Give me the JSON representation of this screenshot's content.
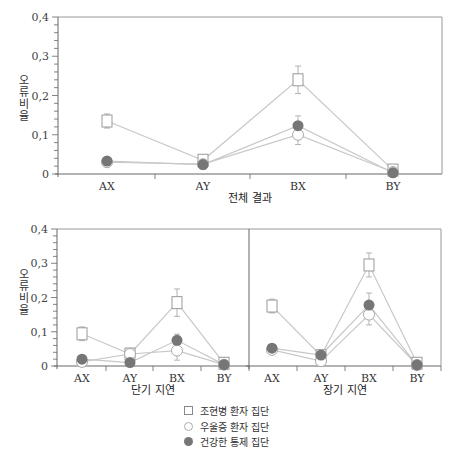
{
  "series_names": [
    "조현병 환자 집단",
    "우울증 환자 집단",
    "건강한 통제 집단"
  ],
  "series_markers": [
    "square",
    "open",
    "filled"
  ],
  "colors": {
    "line": "#c8c8c8",
    "axis": "#666666",
    "filled": "#767676",
    "open_stroke": "#a8a8a8",
    "square_stroke": "#999999"
  },
  "y_axis_label": "오류비율",
  "legend": [
    {
      "marker": "square",
      "label": "조현병 환자 집단"
    },
    {
      "marker": "open",
      "label": "우울증 환자 집단"
    },
    {
      "marker": "filled",
      "label": "건강한 통제 집단"
    }
  ],
  "chart_data": [
    {
      "type": "line",
      "title": "전체 결과",
      "xlabel": "전체 결과",
      "ylabel": "오류비율",
      "categories": [
        "AX",
        "AY",
        "BX",
        "BY"
      ],
      "ylim": [
        0,
        0.4
      ],
      "yticks": [
        "0",
        "0,1",
        "0,2",
        "0,3",
        "0,4"
      ],
      "series": [
        {
          "name": "조현병 환자 집단",
          "values": [
            0.135,
            0.035,
            0.24,
            0.01
          ],
          "err": [
            0.018,
            0.004,
            0.035,
            0.005
          ]
        },
        {
          "name": "우울증 환자 집단",
          "values": [
            0.03,
            0.025,
            0.1,
            0.005
          ],
          "err": [
            0.004,
            0.003,
            0.025,
            0.003
          ]
        },
        {
          "name": "건강한 통제 집단",
          "values": [
            0.033,
            0.024,
            0.123,
            0.003
          ],
          "err": [
            0.004,
            0.003,
            0.025,
            0.003
          ]
        }
      ]
    },
    {
      "type": "line",
      "title": "단기 지연",
      "xlabel": "단기 지연",
      "ylabel": "오류비율",
      "categories": [
        "AX",
        "AY",
        "BX",
        "BY"
      ],
      "ylim": [
        0,
        0.4
      ],
      "yticks": [
        "0",
        "0,1",
        "0,2",
        "0,3",
        "0,4"
      ],
      "series": [
        {
          "name": "조현병 환자 집단",
          "values": [
            0.094,
            0.035,
            0.185,
            0.008
          ],
          "err": [
            0.02,
            0.006,
            0.04,
            0.005
          ]
        },
        {
          "name": "우울증 환자 집단",
          "values": [
            0.012,
            0.035,
            0.045,
            0.004
          ],
          "err": [
            0.004,
            0.006,
            0.028,
            0.003
          ]
        },
        {
          "name": "건강한 통제 집단",
          "values": [
            0.02,
            0.01,
            0.075,
            0.004
          ],
          "err": [
            0.004,
            0.003,
            0.018,
            0.003
          ]
        }
      ]
    },
    {
      "type": "line",
      "title": "장기 지연",
      "xlabel": "장기 지연",
      "ylabel": "",
      "categories": [
        "AX",
        "AY",
        "BX",
        "BY"
      ],
      "ylim": [
        0,
        0.4
      ],
      "series": [
        {
          "name": "조현병 환자 집단",
          "values": [
            0.175,
            0.03,
            0.295,
            0.008
          ],
          "err": [
            0.02,
            0.005,
            0.035,
            0.005
          ]
        },
        {
          "name": "우울증 환자 집단",
          "values": [
            0.047,
            0.014,
            0.15,
            0.003
          ],
          "err": [
            0.004,
            0.003,
            0.03,
            0.003
          ]
        },
        {
          "name": "건강한 통제 집단",
          "values": [
            0.052,
            0.032,
            0.178,
            0.003
          ],
          "err": [
            0.004,
            0.004,
            0.035,
            0.003
          ]
        }
      ]
    }
  ]
}
